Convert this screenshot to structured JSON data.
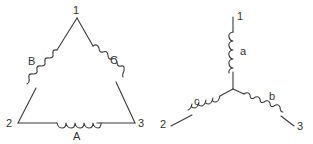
{
  "delta": {
    "nodes": [
      {
        "id": "1",
        "label": "1"
      },
      {
        "id": "2",
        "label": "2"
      },
      {
        "id": "3",
        "label": "3"
      }
    ],
    "windings": [
      {
        "id": "A",
        "label": "A",
        "between": [
          "2",
          "3"
        ]
      },
      {
        "id": "B",
        "label": "B",
        "between": [
          "1",
          "2"
        ]
      },
      {
        "id": "C",
        "label": "C",
        "between": [
          "1",
          "3"
        ]
      }
    ]
  },
  "wye": {
    "terminals": [
      {
        "id": "1",
        "label": "1"
      },
      {
        "id": "2",
        "label": "2"
      },
      {
        "id": "3",
        "label": "3"
      }
    ],
    "windings": [
      {
        "id": "a",
        "label": "a",
        "terminal": "1"
      },
      {
        "id": "b",
        "label": "b",
        "terminal": "3"
      },
      {
        "id": "c",
        "label": "c",
        "terminal": "2"
      }
    ]
  },
  "colors": {
    "line": "#3a3a3a",
    "text": "#333333",
    "background": "#ffffff"
  }
}
